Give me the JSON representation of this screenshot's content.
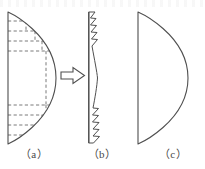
{
  "figure": {
    "title": "",
    "stroke_color": "#4f4f4f",
    "dash_color": "#6b6b6b",
    "fill_color": "#ffffff",
    "background_color": "#ffffff",
    "panels": [
      {
        "id": "a",
        "caption": "（a）",
        "description": "D-shaped lens cross-section with dashed stair-step machining allowance lines at top and bottom",
        "shape": "half-lens-with-dashed-layers",
        "dashed_horizontal_lines_top": 4,
        "dashed_horizontal_lines_bottom": 4,
        "dashed_vertical_steps": 6
      },
      {
        "id": "b",
        "caption": "（b）",
        "description": "Thin crescent sliver of removed material with sawtooth fracture edges at top and bottom",
        "shape": "crescent-sliver-sawtooth",
        "sawtooth_teeth_top": 4,
        "sawtooth_teeth_bottom": 4
      },
      {
        "id": "c",
        "caption": "（c）",
        "description": "Finished clean D-shaped profile",
        "shape": "half-lens-plain"
      }
    ],
    "arrow": {
      "name": "transform-arrow",
      "direction": "right",
      "style": "hollow-outline"
    }
  }
}
